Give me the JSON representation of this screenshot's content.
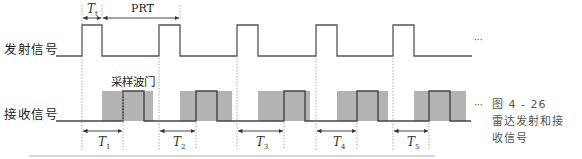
{
  "figure": {
    "caption": {
      "number": "图 4 - 26",
      "line1": "雷达发射和接",
      "line2": "收信号"
    },
    "rows": {
      "transmit_label": "发射信号",
      "receive_label": "接收信号"
    },
    "annotations": {
      "pulse_width_label": "T",
      "pulse_width_sub": "t",
      "prt_label": "PRT",
      "gate_label": "采样波门",
      "ellipsis": "···"
    },
    "delays": [
      {
        "label": "T",
        "sub": "1"
      },
      {
        "label": "T",
        "sub": "2"
      },
      {
        "label": "T",
        "sub": "3"
      },
      {
        "label": "T",
        "sub": "4"
      },
      {
        "label": "T",
        "sub": "5"
      }
    ],
    "colors": {
      "line": "#444444",
      "gate_fill": "#b3b3b3",
      "dotted": "#999999",
      "rule": "#c8c8c8"
    }
  }
}
